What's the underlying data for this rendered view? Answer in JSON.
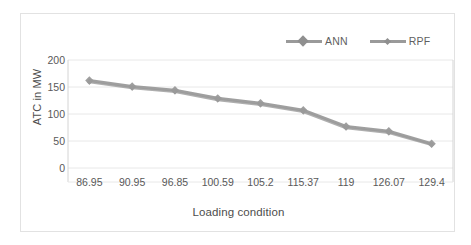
{
  "chart_data": {
    "type": "line",
    "title": "",
    "xlabel": "Loading condition",
    "ylabel": "ATC in MW",
    "categories": [
      "86.95",
      "90.95",
      "96.85",
      "100.59",
      "105.2",
      "115.37",
      "119",
      "126.07",
      "129.4"
    ],
    "series": [
      {
        "name": "ANN",
        "values": [
          162,
          151,
          144,
          129,
          120,
          107,
          77,
          68,
          45
        ],
        "color": "#9a9a9a",
        "marker": "diamond"
      },
      {
        "name": "RPF",
        "values": [
          159,
          148,
          141,
          126,
          117,
          104,
          74,
          65,
          43
        ],
        "color": "#9a9a9a",
        "marker": "diamond-small"
      }
    ],
    "yticks": [
      0,
      50,
      100,
      150,
      200
    ],
    "ylim": [
      0,
      200
    ],
    "grid": true,
    "legend_position": "top-right"
  },
  "legend": {
    "entries": [
      {
        "label": "ANN",
        "marker": "diamond-marker-icon"
      },
      {
        "label": "RPF",
        "marker": "diamond-marker-icon"
      }
    ]
  },
  "axes": {
    "y_title": "ATC in MW",
    "x_title": "Loading condition",
    "y_ticks": [
      "200",
      "150",
      "100",
      "50",
      "0"
    ],
    "x_ticks": [
      "86.95",
      "90.95",
      "96.85",
      "100.59",
      "105.2",
      "115.37",
      "119",
      "126.07",
      "129.4"
    ]
  },
  "colors": {
    "series_line": "#9a9a9a",
    "grid": "#e8e8e8",
    "axis": "#d4d4d4",
    "frame": "#e2e2e2",
    "text": "#595959"
  }
}
